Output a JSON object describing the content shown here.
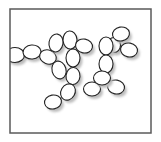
{
  "figure": {
    "background": "#ffffff",
    "frame": {
      "x": 10,
      "y": 9,
      "width": 141,
      "height": 124,
      "stroke": "#5a5a5a",
      "stroke_width": 1.5
    },
    "cell_style": {
      "fill": "#ffffff",
      "stroke": "#222222",
      "stroke_width": 1.1,
      "shadow": "#bdbdbd",
      "shadow_dx": 2.5,
      "shadow_dy": 3
    },
    "cells": [
      {
        "cx": 15,
        "cy": 55,
        "rx": 9.5,
        "ry": 7.5,
        "rot": 0
      },
      {
        "cx": 32,
        "cy": 52,
        "rx": 9,
        "ry": 7,
        "rot": -5
      },
      {
        "cx": 48,
        "cy": 57,
        "rx": 8.5,
        "ry": 7,
        "rot": 20
      },
      {
        "cx": 56,
        "cy": 43,
        "rx": 7,
        "ry": 9,
        "rot": 10
      },
      {
        "cx": 70,
        "cy": 40,
        "rx": 7,
        "ry": 9,
        "rot": -5
      },
      {
        "cx": 84,
        "cy": 46,
        "rx": 8.5,
        "ry": 7,
        "rot": 10
      },
      {
        "cx": 73,
        "cy": 58,
        "rx": 7,
        "ry": 9,
        "rot": 0
      },
      {
        "cx": 59,
        "cy": 70,
        "rx": 7,
        "ry": 9,
        "rot": -15
      },
      {
        "cx": 73,
        "cy": 76,
        "rx": 7,
        "ry": 8.5,
        "rot": 5
      },
      {
        "cx": 68,
        "cy": 92,
        "rx": 7,
        "ry": 8.5,
        "rot": 30
      },
      {
        "cx": 53,
        "cy": 102,
        "rx": 8.5,
        "ry": 7,
        "rot": -10
      },
      {
        "cx": 114,
        "cy": 45,
        "rx": 6.5,
        "ry": 7.5,
        "rot": 0
      },
      {
        "cx": 106,
        "cy": 46,
        "rx": 7,
        "ry": 9,
        "rot": 0
      },
      {
        "cx": 121,
        "cy": 34,
        "rx": 8.5,
        "ry": 7,
        "rot": -10
      },
      {
        "cx": 129,
        "cy": 50,
        "rx": 8.5,
        "ry": 7,
        "rot": 10
      },
      {
        "cx": 106,
        "cy": 64,
        "rx": 7,
        "ry": 9,
        "rot": 0
      },
      {
        "cx": 92,
        "cy": 89,
        "rx": 8.5,
        "ry": 7,
        "rot": 0
      },
      {
        "cx": 116,
        "cy": 87,
        "rx": 8.5,
        "ry": 7,
        "rot": 10
      },
      {
        "cx": 102,
        "cy": 78,
        "rx": 8.5,
        "ry": 7,
        "rot": 0
      }
    ]
  }
}
